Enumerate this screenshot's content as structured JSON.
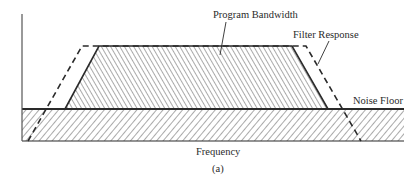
{
  "figure": {
    "caption": "(a)",
    "x_axis_label": "Frequency",
    "labels": {
      "program_bandwidth": "Program Bandwidth",
      "filter_response": "Filter Response",
      "noise_floor": "Noise Floor"
    },
    "colors": {
      "ink": "#2a2a2a",
      "background": "#ffffff"
    },
    "shapes": {
      "program_bandwidth": {
        "style": "solid outline, right-diagonal hatch",
        "points": [
          [
            65,
            109
          ],
          [
            99,
            46
          ],
          [
            292,
            46
          ],
          [
            328,
            109
          ]
        ]
      },
      "filter_response": {
        "style": "dashed outline",
        "points": [
          [
            28,
            141
          ],
          [
            82,
            46
          ],
          [
            306,
            46
          ],
          [
            361,
            141
          ]
        ]
      },
      "noise_floor": {
        "style": "solid band, left-diagonal hatch",
        "x": [
          22,
          404
        ],
        "y": [
          109,
          141
        ]
      }
    }
  }
}
